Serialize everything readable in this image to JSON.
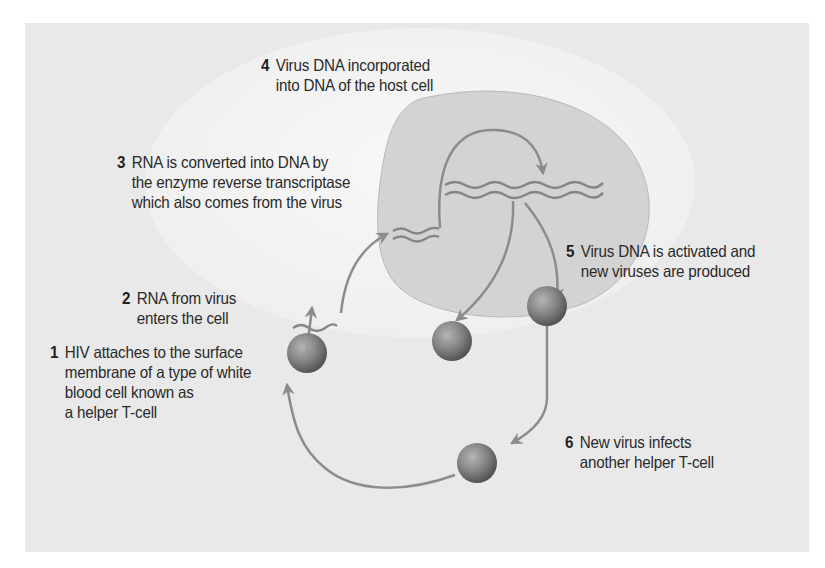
{
  "diagram": {
    "colors": {
      "panel_background": "#e9e9e9",
      "host_cell": "#f4f4f4",
      "nucleus": "#d3d3d3",
      "arrows": "#8c8c8c",
      "virus_particle": "#7e7e7e",
      "text": "#2a2a2a"
    },
    "steps": [
      {
        "number": "1",
        "lines": [
          "HIV attaches to the surface",
          "membrane of a type of white",
          "blood cell known as",
          "a helper T-cell"
        ]
      },
      {
        "number": "2",
        "lines": [
          "RNA from virus",
          "enters the cell"
        ]
      },
      {
        "number": "3",
        "lines": [
          "RNA is converted into DNA by",
          "the enzyme reverse transcriptase",
          "which also comes from the virus"
        ]
      },
      {
        "number": "4",
        "lines": [
          "Virus DNA incorporated",
          "into DNA of the host cell"
        ]
      },
      {
        "number": "5",
        "lines": [
          "Virus DNA is activated and",
          "new viruses are produced"
        ]
      },
      {
        "number": "6",
        "lines": [
          "New virus infects",
          "another helper T-cell"
        ]
      }
    ],
    "elements": {
      "host_cell": "helper T-cell",
      "nucleus": "host cell nucleus",
      "virus_particles": 4,
      "rna_strand": "virus RNA",
      "dna_strands": [
        "converted viral DNA",
        "host DNA with incorporated viral DNA"
      ]
    }
  }
}
